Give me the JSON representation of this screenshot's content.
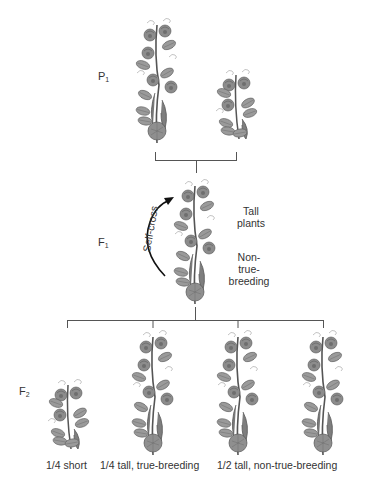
{
  "diagram": {
    "generations": {
      "p1": {
        "label": "P",
        "sub": "1"
      },
      "f1": {
        "label": "F",
        "sub": "1"
      },
      "f2": {
        "label": "F",
        "sub": "2"
      }
    },
    "f1_notes": {
      "phenotype_line1": "Tall",
      "phenotype_line2": "plants",
      "genotype_line1": "Non-",
      "genotype_line2": "true-",
      "genotype_line3": "breeding"
    },
    "self_cross_label": "Self-cross",
    "f2_captions": {
      "short": "1/4 short",
      "tall_true": "1/4 tall, true-breeding",
      "tall_non_true": "1/2 tall, non-true-breeding"
    },
    "plants": {
      "p1": [
        "tall",
        "short"
      ],
      "f1": [
        "tall"
      ],
      "f2": [
        "short",
        "tall",
        "tall",
        "tall"
      ]
    },
    "colors": {
      "line": "#555555",
      "plant_fill": "#8a8a8a",
      "plant_stroke": "#5c5c5c",
      "arrow": "#111111"
    }
  }
}
